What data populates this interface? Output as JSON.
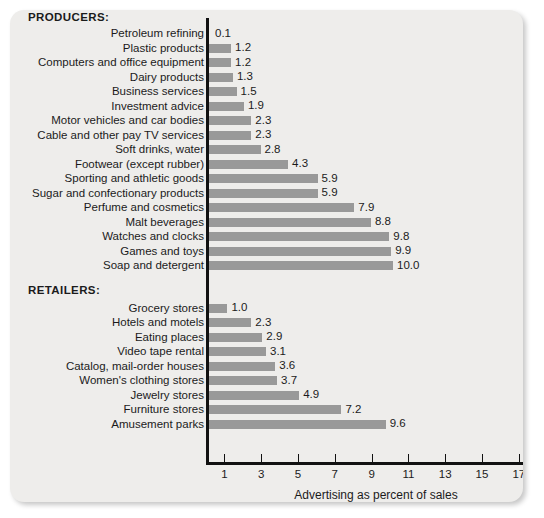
{
  "chart_data": {
    "type": "bar",
    "orientation": "horizontal",
    "title": "",
    "xlabel": "Advertising as percent of sales",
    "ylabel": "",
    "xlim": [
      0,
      17.6
    ],
    "xticks": [
      1,
      3,
      5,
      7,
      9,
      11,
      13,
      15,
      17
    ],
    "xticklabels": [
      "1",
      "3",
      "5",
      "7",
      "9",
      "11",
      "13",
      "15",
      "17"
    ],
    "grid": false,
    "legend": null,
    "bar_color": "#999999",
    "groups": [
      {
        "name": "PRODUCERS:",
        "categories": [
          "Petroleum refining",
          "Plastic products",
          "Computers and office equipment",
          "Dairy products",
          "Business services",
          "Investment advice",
          "Motor vehicles and car bodies",
          "Cable and other pay TV services",
          "Soft drinks, water",
          "Footwear (except rubber)",
          "Sporting and athletic goods",
          "Sugar and confectionary products",
          "Perfume and cosmetics",
          "Malt beverages",
          "Watches and clocks",
          "Games and toys",
          "Soap and detergent"
        ],
        "values": [
          0.1,
          1.2,
          1.2,
          1.3,
          1.5,
          1.9,
          2.3,
          2.3,
          2.8,
          4.3,
          5.9,
          5.9,
          7.9,
          8.8,
          9.8,
          9.9,
          10.0
        ],
        "labels": [
          "0.1",
          "1.2",
          "1.2",
          "1.3",
          "1.5",
          "1.9",
          "2.3",
          "2.3",
          "2.8",
          "4.3",
          "5.9",
          "5.9",
          "7.9",
          "8.8",
          "9.8",
          "9.9",
          "10.0"
        ]
      },
      {
        "name": "RETAILERS:",
        "categories": [
          "Grocery stores",
          "Hotels and motels",
          "Eating places",
          "Video tape rental",
          "Catalog, mail-order houses",
          "Women's clothing stores",
          "Jewelry stores",
          "Furniture stores",
          "Amusement parks"
        ],
        "values": [
          1.0,
          2.3,
          2.9,
          3.1,
          3.6,
          3.7,
          4.9,
          7.2,
          9.6
        ],
        "labels": [
          "1.0",
          "2.3",
          "2.9",
          "3.1",
          "3.6",
          "3.7",
          "4.9",
          "7.2",
          "9.6"
        ]
      }
    ]
  }
}
